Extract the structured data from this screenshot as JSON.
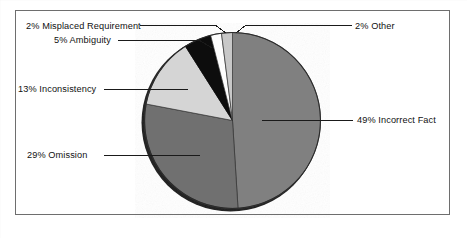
{
  "figure": {
    "name": "requirement-defect-distribution-pie",
    "background": "#ffffff",
    "frame_color": "#6e6e6e"
  },
  "chart_data": {
    "type": "pie",
    "title": "",
    "subtitle": "",
    "xlabel": "",
    "ylabel": "",
    "legend_position": "none",
    "labels_style": "callout-leader-lines",
    "units": "percent",
    "total": 100,
    "start_angle_deg": 0,
    "direction": "clockwise",
    "categories": [
      "Incorrect Fact",
      "Omission",
      "Inconsistency",
      "Ambiguity",
      "Misplaced Requirement",
      "Other"
    ],
    "values": [
      49,
      29,
      13,
      5,
      2,
      2
    ],
    "colors": [
      "#808080",
      "#6f6f6f",
      "#d5d5d5",
      "#0a0a0a",
      "#fdfdfd",
      "#c8c8c8"
    ],
    "slices": [
      {
        "label": "49% Incorrect Fact",
        "name": "Incorrect Fact",
        "value": 49,
        "color": "#808080",
        "start_deg": 0,
        "end_deg": 176.4,
        "callout_side": "right"
      },
      {
        "label": "29% Omission",
        "name": "Omission",
        "value": 29,
        "color": "#6f6f6f",
        "start_deg": 176.4,
        "end_deg": 280.8,
        "callout_side": "left"
      },
      {
        "label": "13% Inconsistency",
        "name": "Inconsistency",
        "value": 13,
        "color": "#d5d5d5",
        "start_deg": 280.8,
        "end_deg": 327.6,
        "callout_side": "left"
      },
      {
        "label": "5% Ambiguity",
        "name": "Ambiguity",
        "value": 5,
        "color": "#0a0a0a",
        "start_deg": 327.6,
        "end_deg": 345.6,
        "callout_side": "left"
      },
      {
        "label": "2% Misplaced Requirement",
        "name": "Misplaced Requirement",
        "value": 2,
        "color": "#fdfdfd",
        "start_deg": 345.6,
        "end_deg": 352.8,
        "callout_side": "left"
      },
      {
        "label": "2% Other",
        "name": "Other",
        "value": 2,
        "color": "#c8c8c8",
        "start_deg": 352.8,
        "end_deg": 360,
        "callout_side": "right"
      }
    ]
  }
}
